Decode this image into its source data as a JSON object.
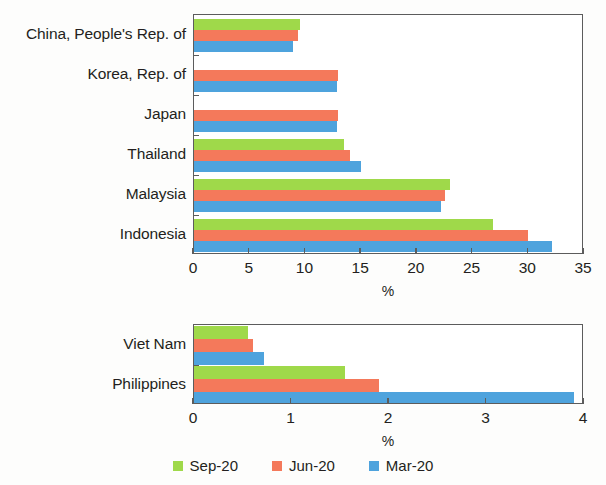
{
  "legend": {
    "position": "bottom-center",
    "entries": [
      {
        "label": "Sep-20",
        "color": "#9fd94a",
        "key": "sep"
      },
      {
        "label": "Jun-20",
        "color": "#f4795b",
        "key": "jun"
      },
      {
        "label": "Mar-20",
        "color": "#4ea3dd",
        "key": "mar"
      }
    ]
  },
  "chart_data": [
    {
      "type": "bar",
      "orientation": "horizontal",
      "title": "",
      "xlabel": "%",
      "ylabel": "",
      "xlim": [
        0,
        35
      ],
      "xticks": [
        0,
        5,
        10,
        15,
        20,
        25,
        30,
        35
      ],
      "xticklabels": [
        "0",
        "5",
        "10",
        "15",
        "20",
        "25",
        "30",
        "35"
      ],
      "grid": false,
      "categories": [
        "China, People's Rep. of",
        "Korea, Rep. of",
        "Japan",
        "Thailand",
        "Malaysia",
        "Indonesia"
      ],
      "series": [
        {
          "name": "Sep-20",
          "color": "#9fd94a",
          "values": [
            9.5,
            0,
            0,
            13.5,
            23.0,
            26.8
          ]
        },
        {
          "name": "Jun-20",
          "color": "#f4795b",
          "values": [
            9.3,
            12.9,
            12.9,
            14.0,
            22.5,
            30.0
          ]
        },
        {
          "name": "Mar-20",
          "color": "#4ea3dd",
          "values": [
            8.9,
            12.8,
            12.8,
            15.0,
            22.2,
            32.1
          ]
        }
      ]
    },
    {
      "type": "bar",
      "orientation": "horizontal",
      "title": "",
      "xlabel": "%",
      "ylabel": "",
      "xlim": [
        0,
        4
      ],
      "xticks": [
        0,
        1,
        2,
        3,
        4
      ],
      "xticklabels": [
        "0",
        "1",
        "2",
        "3",
        "4"
      ],
      "grid": false,
      "categories": [
        "Viet Nam",
        "Philippines"
      ],
      "series": [
        {
          "name": "Sep-20",
          "color": "#9fd94a",
          "values": [
            0.55,
            1.55
          ]
        },
        {
          "name": "Jun-20",
          "color": "#f4795b",
          "values": [
            0.6,
            1.9
          ]
        },
        {
          "name": "Mar-20",
          "color": "#4ea3dd",
          "values": [
            0.72,
            3.9
          ]
        }
      ]
    }
  ],
  "panels": [
    {
      "name": "upper-panel",
      "plot": {
        "left": 193,
        "top": 14,
        "width": 390,
        "height": 240
      },
      "labels_right": 186,
      "axis_title_y": 284,
      "tick_label_y": 260
    },
    {
      "name": "lower-panel",
      "plot": {
        "left": 193,
        "top": 324,
        "width": 390,
        "height": 80
      },
      "labels_right": 186,
      "axis_title_y": 434,
      "tick_label_y": 410
    }
  ]
}
